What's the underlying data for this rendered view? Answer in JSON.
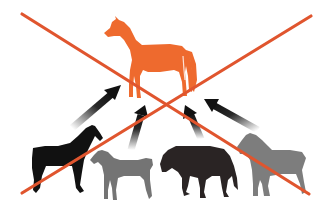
{
  "figure": {
    "alt": "Crossed-out diagram: four different horse types with arrows pointing up toward a single orange ideal horse",
    "colors": {
      "background": "#ffffff",
      "target_horse": "#EE6A2E",
      "cross_lines": "#E0552E",
      "black_horse": "#111111",
      "gray_horse": "#747474",
      "dark_horse": "#2a2424",
      "light_gray_horse": "#7d7d7d",
      "arrow": "#111111"
    },
    "target": {
      "label": "orange-horse",
      "x": 102,
      "y": 17,
      "width": 95,
      "height": 82
    },
    "sources": [
      {
        "label": "black-horse",
        "x": 30,
        "y": 124
      },
      {
        "label": "gray-horse",
        "x": 88,
        "y": 148
      },
      {
        "label": "dark-brown-horse",
        "x": 158,
        "y": 143
      },
      {
        "label": "light-gray-horse",
        "x": 236,
        "y": 133
      }
    ],
    "arrows": [
      {
        "from": [
          75,
          125
        ],
        "to": [
          120,
          87
        ]
      },
      {
        "from": [
          132,
          148
        ],
        "to": [
          144,
          108
        ]
      },
      {
        "from": [
          200,
          137
        ],
        "to": [
          188,
          107
        ]
      },
      {
        "from": [
          257,
          128
        ],
        "to": [
          207,
          101
        ]
      }
    ],
    "cross": {
      "line1": {
        "from": [
          22,
          14
        ],
        "to": [
          309,
          194
        ]
      },
      "line2": {
        "from": [
          311,
          16
        ],
        "to": [
          22,
          193
        ]
      }
    }
  }
}
